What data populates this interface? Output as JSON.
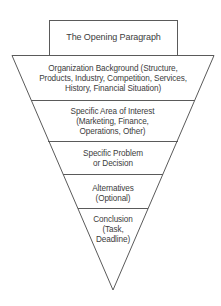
{
  "diagram": {
    "type": "inverted-funnel",
    "header_box": {
      "label": "The Opening Paragraph"
    },
    "levels": [
      {
        "label": "Organization Background (Structure, Products, Industry, Competition, Services, History, Financial Situation)",
        "lines": [
          "Organization Background (Structure,",
          "Products, Industry, Competition, Services,",
          "History, Financial Situation)"
        ]
      },
      {
        "label": "Specific Area of Interest (Marketing, Finance, Operations, Other)",
        "lines": [
          "Specific Area of Interest",
          "(Marketing, Finance,",
          "Operations, Other)"
        ]
      },
      {
        "label": "Specific Problem or Decision",
        "lines": [
          "Specific Problem",
          "or Decision"
        ]
      },
      {
        "label": "Alternatives (Optional)",
        "lines": [
          "Alternatives",
          "(Optional)"
        ]
      },
      {
        "label": "Conclusion (Task, Deadline)",
        "lines": [
          "Conclusion",
          "(Task,",
          "Deadline)"
        ]
      }
    ],
    "colors": {
      "stroke": "#5a5a5a",
      "text": "#3c3c3c",
      "background": "#ffffff"
    }
  }
}
